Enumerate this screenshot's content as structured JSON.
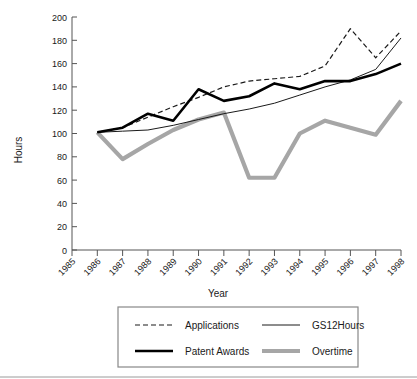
{
  "chart_data": {
    "type": "line",
    "title": "",
    "xlabel": "Year",
    "ylabel": "Hours",
    "x": [
      1985,
      1986,
      1987,
      1988,
      1989,
      1990,
      1991,
      1992,
      1993,
      1994,
      1995,
      1996,
      1997,
      1998
    ],
    "categories": [
      "1985",
      "1986",
      "1987",
      "1988",
      "1989",
      "1990",
      "1991",
      "1992",
      "1993",
      "1994",
      "1995",
      "1996",
      "1997",
      "1998"
    ],
    "xlim": [
      1985,
      1998
    ],
    "ylim": [
      0,
      200
    ],
    "yticks": [
      0,
      20,
      40,
      60,
      80,
      100,
      120,
      140,
      160,
      180,
      200
    ],
    "ytick_labels": [
      "0",
      "20",
      "40",
      "60",
      "80",
      "100",
      "120",
      "140",
      "160",
      "180",
      "200"
    ],
    "grid": false,
    "legend_position": "bottom",
    "series": [
      {
        "name": "Applications",
        "style": "dashed",
        "color": "#1a1a1a",
        "width": 1.2,
        "x": [
          1986,
          1987,
          1988,
          1989,
          1990,
          1991,
          1992,
          1993,
          1994,
          1995,
          1996,
          1997,
          1998
        ],
        "values": [
          101,
          105,
          114,
          123,
          131,
          140,
          145,
          147,
          149,
          158,
          190,
          165,
          188
        ]
      },
      {
        "name": "GS12Hours",
        "style": "solid-thin",
        "color": "#1a1a1a",
        "width": 1.0,
        "x": [
          1986,
          1987,
          1988,
          1989,
          1990,
          1991,
          1992,
          1993,
          1994,
          1995,
          1996,
          1997,
          1998
        ],
        "values": [
          101,
          102,
          103,
          107,
          112,
          117,
          121,
          126,
          133,
          140,
          146,
          155,
          182
        ]
      },
      {
        "name": "Patent Awards",
        "style": "solid-thick",
        "color": "#000000",
        "width": 2.6,
        "x": [
          1986,
          1987,
          1988,
          1989,
          1990,
          1991,
          1992,
          1993,
          1994,
          1995,
          1996,
          1997,
          1998
        ],
        "values": [
          101,
          105,
          117,
          111,
          138,
          128,
          132,
          143,
          138,
          145,
          145,
          151,
          160
        ]
      },
      {
        "name": "Overtime",
        "style": "solid-thick-gray",
        "color": "#a6a6a6",
        "width": 4.2,
        "x": [
          1986,
          1987,
          1988,
          1989,
          1990,
          1991,
          1992,
          1993,
          1994,
          1995,
          1996,
          1997,
          1998
        ],
        "values": [
          101,
          78,
          91,
          103,
          112,
          118,
          62,
          62,
          100,
          111,
          105,
          99,
          128
        ]
      }
    ]
  },
  "legend": {
    "entries": [
      {
        "label": "Applications",
        "style": "dashed"
      },
      {
        "label": "GS12Hours",
        "style": "solid-thin"
      },
      {
        "label": "Patent Awards",
        "style": "solid-thick"
      },
      {
        "label": "Overtime",
        "style": "solid-thick-gray"
      }
    ]
  },
  "colors": {
    "axis": "#555555",
    "text": "#1a1a1a",
    "series_black": "#000000",
    "series_gray": "#a6a6a6",
    "legend_border": "#888888"
  }
}
